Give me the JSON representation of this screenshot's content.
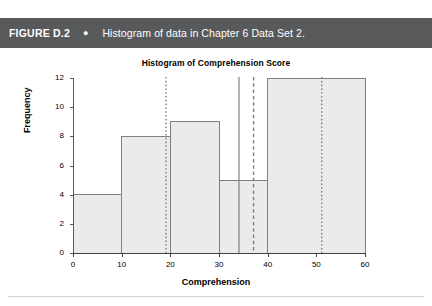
{
  "caption": {
    "figure_label": "FIGURE D.2",
    "bullet": "●",
    "text": "Histogram of data in Chapter 6 Data Set 2."
  },
  "colors": {
    "caption_bar": "#58595b",
    "caption_text": "#ffffff",
    "bar_fill": "#ebebeb",
    "bar_stroke": "#808080",
    "axis": "#595959",
    "reference_line": "#808080",
    "page_background": "#ffffff",
    "divider": "#d3d3d3"
  },
  "chart_data": {
    "type": "bar",
    "title": "Histogram of Comprehension Score",
    "xlabel": "Comprehension",
    "ylabel": "Frequency",
    "xlim": [
      0,
      60
    ],
    "ylim": [
      0,
      12
    ],
    "xticks": [
      0,
      10,
      20,
      30,
      40,
      50,
      60
    ],
    "yticks": [
      0,
      2,
      4,
      6,
      8,
      10,
      12
    ],
    "grid": false,
    "legend": "none",
    "categories": [
      "0–10",
      "10–20",
      "20–30",
      "30–40",
      "40–60"
    ],
    "values": [
      4,
      8,
      9,
      5,
      12
    ],
    "bins": [
      {
        "label": "0–10",
        "start": 0,
        "end": 10,
        "value": 4
      },
      {
        "label": "10–20",
        "start": 10,
        "end": 20,
        "value": 8
      },
      {
        "label": "20–30",
        "start": 20,
        "end": 30,
        "value": 9
      },
      {
        "label": "30–40",
        "start": 30,
        "end": 40,
        "value": 5
      },
      {
        "label": "40–60",
        "start": 40,
        "end": 60,
        "value": 12
      }
    ],
    "reference_lines": [
      {
        "x": 19.0,
        "style": "dotted"
      },
      {
        "x": 34.0,
        "style": "solid"
      },
      {
        "x": 37.0,
        "style": "dashed"
      },
      {
        "x": 51.0,
        "style": "dotted"
      }
    ]
  }
}
